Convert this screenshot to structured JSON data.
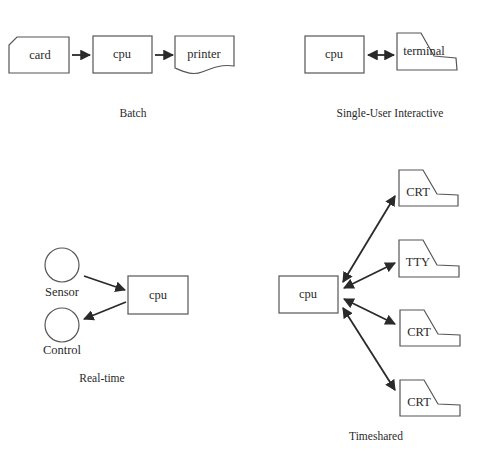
{
  "diagram": {
    "batch": {
      "caption": "Batch",
      "nodes": {
        "card": "card",
        "cpu": "cpu",
        "printer": "printer"
      }
    },
    "single_user": {
      "caption": "Single-User Interactive",
      "nodes": {
        "cpu": "cpu",
        "terminal": "terminal"
      }
    },
    "realtime": {
      "caption": "Real-time",
      "nodes": {
        "sensor": "Sensor",
        "control": "Control",
        "cpu": "cpu"
      }
    },
    "timeshared": {
      "caption": "Timeshared",
      "nodes": {
        "cpu": "cpu",
        "terminals": [
          "CRT",
          "TTY",
          "CRT",
          "CRT"
        ]
      }
    }
  },
  "colors": {
    "stroke": "#555555",
    "arrow": "#2a2a2a",
    "text": "#2a2a2a",
    "background": "#ffffff"
  }
}
